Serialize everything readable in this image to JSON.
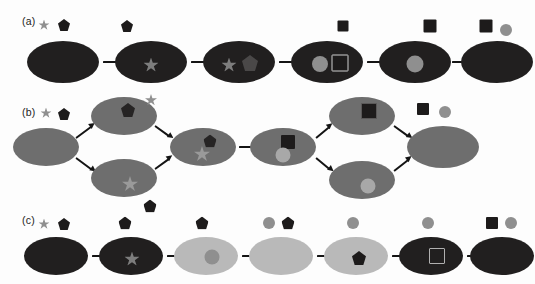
{
  "figure": {
    "background_color": "#fdfdfd",
    "width": 535,
    "height": 284
  },
  "palette": {
    "cell_dark": "#211f1f",
    "cell_mid_gray": "#6e6e6e",
    "cell_light_gray": "#b9b9b9",
    "marker_dark": "#1d1b1b",
    "marker_gray": "#8f8f8f",
    "marker_light_gray": "#a8a8a8",
    "marker_mid_gray": "#7d7d7d",
    "outline_light": "#cfcfcf",
    "arrow_color": "#141414",
    "label_color": "#1c1c1c"
  },
  "panels": [
    {
      "id": "a",
      "label": "(a)",
      "label_x": 22,
      "label_y": 22,
      "topology": "linear",
      "legend": [
        {
          "name": "legend-star",
          "shape": "star",
          "color": "#8f8f8f",
          "x": 44,
          "y": 25,
          "size": 11
        },
        {
          "name": "legend-pentagon",
          "shape": "pentagon",
          "color": "#1d1b1b",
          "x": 64,
          "y": 25,
          "size": 12
        }
      ],
      "stages": [
        {
          "index": 1,
          "cx": 63,
          "cy": 62,
          "rx": 36,
          "ry": 21,
          "fill": "#211f1f",
          "above": [],
          "inner": []
        },
        {
          "index": 2,
          "cx": 151,
          "cy": 62,
          "rx": 36,
          "ry": 21,
          "fill": "#211f1f",
          "above": [
            {
              "name": "pentagon-free",
              "shape": "pentagon",
              "color": "#1d1b1b",
              "dx": -24,
              "dy": -36,
              "size": 12
            }
          ],
          "inner": [
            {
              "name": "star-bound",
              "shape": "star",
              "color": "#7d7d7d",
              "dx": 0,
              "dy": 3,
              "size": 15
            }
          ]
        },
        {
          "index": 3,
          "cx": 239,
          "cy": 62,
          "rx": 36,
          "ry": 21,
          "fill": "#211f1f",
          "above": [],
          "inner": [
            {
              "name": "star-bound",
              "shape": "star",
              "color": "#7d7d7d",
              "dx": -10,
              "dy": 3,
              "size": 15
            },
            {
              "name": "pentagon-outline-bound",
              "shape": "pentagon-outline",
              "color": "#4a4848",
              "dx": 11,
              "dy": 1,
              "size": 16
            }
          ]
        },
        {
          "index": 4,
          "cx": 327,
          "cy": 62,
          "rx": 36,
          "ry": 21,
          "fill": "#211f1f",
          "above": [
            {
              "name": "square-free",
              "shape": "square",
              "color": "#1d1b1b",
              "dx": 16,
              "dy": -36,
              "size": 11
            }
          ],
          "inner": [
            {
              "name": "circle-bound",
              "shape": "circle",
              "color": "#8f8f8f",
              "dx": -7,
              "dy": 2,
              "size": 16
            },
            {
              "name": "square-outline-bound",
              "shape": "square-outline",
              "color": "#1d1b1b",
              "outline": "#cfcfcf",
              "dx": 13,
              "dy": 1,
              "size": 17
            }
          ]
        },
        {
          "index": 5,
          "cx": 415,
          "cy": 62,
          "rx": 36,
          "ry": 21,
          "fill": "#211f1f",
          "above": [
            {
              "name": "square-free",
              "shape": "square",
              "color": "#1d1b1b",
              "dx": 15,
              "dy": -36,
              "size": 13
            }
          ],
          "inner": [
            {
              "name": "circle-bound",
              "shape": "circle",
              "color": "#8f8f8f",
              "dx": 0,
              "dy": 2,
              "size": 17
            }
          ]
        },
        {
          "index": 6,
          "cx": 497,
          "cy": 62,
          "rx": 36,
          "ry": 21,
          "fill": "#211f1f",
          "above": [
            {
              "name": "square-free",
              "shape": "square",
              "color": "#1d1b1b",
              "dx": -11,
              "dy": -36,
              "size": 13
            },
            {
              "name": "circle-free",
              "shape": "circle",
              "color": "#8f8f8f",
              "dx": 9,
              "dy": -32,
              "size": 12
            }
          ],
          "inner": []
        }
      ],
      "arrows": [
        {
          "name": "arrow-a1",
          "x1": 103,
          "y1": 62,
          "x2": 127,
          "y2": 62
        },
        {
          "name": "arrow-a2",
          "x1": 191,
          "y1": 62,
          "x2": 215,
          "y2": 62
        },
        {
          "name": "arrow-a3",
          "x1": 279,
          "y1": 62,
          "x2": 303,
          "y2": 62
        },
        {
          "name": "arrow-a4",
          "x1": 367,
          "y1": 62,
          "x2": 391,
          "y2": 62
        },
        {
          "name": "arrow-a5",
          "x1": 452,
          "y1": 62,
          "x2": 472,
          "y2": 62
        }
      ]
    },
    {
      "id": "b",
      "label": "(b)",
      "label_x": 22,
      "label_y": 113,
      "topology": "branching",
      "legend": [
        {
          "name": "legend-star",
          "shape": "star",
          "color": "#8f8f8f",
          "x": 46,
          "y": 113,
          "size": 11
        },
        {
          "name": "legend-pentagon",
          "shape": "pentagon",
          "color": "#1d1b1b",
          "x": 64,
          "y": 114,
          "size": 12
        }
      ],
      "stages": [
        {
          "index": 1,
          "cx": 46,
          "cy": 147,
          "rx": 33,
          "ry": 19,
          "fill": "#6e6e6e",
          "above": [],
          "inner": []
        },
        {
          "index": 2,
          "cx": 124,
          "cy": 116,
          "rx": 33,
          "ry": 19,
          "fill": "#6e6e6e",
          "above": [
            {
              "name": "star-free",
              "shape": "star",
              "color": "#8f8f8f",
              "dx": 27,
              "dy": -16,
              "size": 12
            }
          ],
          "inner": [
            {
              "name": "pentagon-bound",
              "shape": "pentagon",
              "color": "#262424",
              "dx": 4,
              "dy": -6,
              "size": 14
            }
          ]
        },
        {
          "index": 3,
          "cx": 124,
          "cy": 178,
          "rx": 33,
          "ry": 19,
          "fill": "#6e6e6e",
          "above": [
            {
              "name": "pentagon-free",
              "shape": "pentagon",
              "color": "#1d1b1b",
              "dx": 26,
              "dy": 28,
              "size": 13
            }
          ],
          "inner": [
            {
              "name": "star-bound",
              "shape": "star",
              "color": "#9a9a9a",
              "dx": 6,
              "dy": 6,
              "size": 16
            }
          ]
        },
        {
          "index": 4,
          "cx": 203,
          "cy": 147,
          "rx": 33,
          "ry": 19,
          "fill": "#6e6e6e",
          "above": [],
          "inner": [
            {
              "name": "pentagon-bound",
              "shape": "pentagon",
              "color": "#262424",
              "dx": 7,
              "dy": -6,
              "size": 13
            },
            {
              "name": "star-bound",
              "shape": "star",
              "color": "#9a9a9a",
              "dx": -1,
              "dy": 7,
              "size": 16
            }
          ]
        },
        {
          "index": 5,
          "cx": 283,
          "cy": 147,
          "rx": 33,
          "ry": 19,
          "fill": "#6e6e6e",
          "above": [],
          "inner": [
            {
              "name": "square-bound",
              "shape": "square",
              "color": "#1d1b1b",
              "dx": 5,
              "dy": -5,
              "size": 14
            },
            {
              "name": "circle-bound",
              "shape": "circle",
              "color": "#a8a8a8",
              "dx": 0,
              "dy": 8,
              "size": 15
            }
          ]
        },
        {
          "index": 6,
          "cx": 362,
          "cy": 116,
          "rx": 33,
          "ry": 19,
          "fill": "#6e6e6e",
          "above": [],
          "inner": [
            {
              "name": "square-outline-bound",
              "shape": "square-outline",
              "color": "#1d1b1b",
              "outline": "#5a5858",
              "dx": 7,
              "dy": -5,
              "size": 16
            }
          ]
        },
        {
          "index": 7,
          "cx": 362,
          "cy": 180,
          "rx": 33,
          "ry": 19,
          "fill": "#6e6e6e",
          "above": [],
          "inner": [
            {
              "name": "circle-bound",
              "shape": "circle",
              "color": "#a8a8a8",
              "dx": 6,
              "dy": 6,
              "size": 15
            }
          ]
        },
        {
          "index": 8,
          "cx": 443,
          "cy": 147,
          "rx": 36,
          "ry": 21,
          "fill": "#6e6e6e",
          "above": [
            {
              "name": "square-free",
              "shape": "square",
              "color": "#1d1b1b",
              "dx": -20,
              "dy": -38,
              "size": 12
            },
            {
              "name": "circle-free",
              "shape": "circle",
              "color": "#8f8f8f",
              "dx": 2,
              "dy": -35,
              "size": 12
            }
          ],
          "inner": []
        }
      ],
      "arrows": [
        {
          "name": "arrow-b1-up",
          "x1": 76,
          "y1": 138,
          "x2": 95,
          "y2": 124
        },
        {
          "name": "arrow-b1-down",
          "x1": 76,
          "y1": 158,
          "x2": 95,
          "y2": 172
        },
        {
          "name": "arrow-b2-down",
          "x1": 155,
          "y1": 126,
          "x2": 173,
          "y2": 139
        },
        {
          "name": "arrow-b3-up",
          "x1": 155,
          "y1": 169,
          "x2": 173,
          "y2": 156
        },
        {
          "name": "arrow-b4",
          "x1": 239,
          "y1": 147,
          "x2": 262,
          "y2": 147
        },
        {
          "name": "arrow-b5-up",
          "x1": 316,
          "y1": 138,
          "x2": 333,
          "y2": 124
        },
        {
          "name": "arrow-b5-down",
          "x1": 316,
          "y1": 158,
          "x2": 333,
          "y2": 172
        },
        {
          "name": "arrow-b6-down",
          "x1": 394,
          "y1": 126,
          "x2": 412,
          "y2": 139
        },
        {
          "name": "arrow-b7-up",
          "x1": 394,
          "y1": 171,
          "x2": 412,
          "y2": 157
        }
      ]
    },
    {
      "id": "c",
      "label": "(c)",
      "label_x": 22,
      "label_y": 221,
      "topology": "linear",
      "legend": [
        {
          "name": "legend-star",
          "shape": "star",
          "color": "#8f8f8f",
          "x": 44,
          "y": 224,
          "size": 11
        },
        {
          "name": "legend-pentagon",
          "shape": "pentagon",
          "color": "#1d1b1b",
          "x": 64,
          "y": 224,
          "size": 12
        }
      ],
      "stages": [
        {
          "index": 1,
          "cx": 56,
          "cy": 256,
          "rx": 32,
          "ry": 19,
          "fill": "#211f1f",
          "above": [],
          "inner": []
        },
        {
          "index": 2,
          "cx": 131,
          "cy": 256,
          "rx": 32,
          "ry": 19,
          "fill": "#211f1f",
          "above": [
            {
              "name": "pentagon-free",
              "shape": "pentagon",
              "color": "#1d1b1b",
              "dx": -6,
              "dy": -33,
              "size": 13
            }
          ],
          "inner": [
            {
              "name": "star-bound",
              "shape": "star",
              "color": "#7d7d7d",
              "dx": 1,
              "dy": 3,
              "size": 15
            }
          ]
        },
        {
          "index": 3,
          "cx": 206,
          "cy": 256,
          "rx": 32,
          "ry": 19,
          "fill": "#b9b9b9",
          "above": [
            {
              "name": "pentagon-free",
              "shape": "pentagon",
              "color": "#1d1b1b",
              "dx": -4,
              "dy": -33,
              "size": 13
            }
          ],
          "inner": [
            {
              "name": "circle-bound",
              "shape": "circle",
              "color": "#8f8f8f",
              "dx": 6,
              "dy": 1,
              "size": 15
            }
          ]
        },
        {
          "index": 4,
          "cx": 281,
          "cy": 256,
          "rx": 32,
          "ry": 19,
          "fill": "#b9b9b9",
          "above": [
            {
              "name": "circle-free",
              "shape": "circle",
              "color": "#8f8f8f",
              "dx": -12,
              "dy": -33,
              "size": 12
            },
            {
              "name": "pentagon-free",
              "shape": "pentagon",
              "color": "#1d1b1b",
              "dx": 7,
              "dy": -33,
              "size": 13
            }
          ],
          "inner": []
        },
        {
          "index": 5,
          "cx": 356,
          "cy": 256,
          "rx": 32,
          "ry": 19,
          "fill": "#b9b9b9",
          "above": [
            {
              "name": "circle-free",
              "shape": "circle",
              "color": "#8f8f8f",
              "dx": -3,
              "dy": -33,
              "size": 12
            }
          ],
          "inner": [
            {
              "name": "pentagon-bound",
              "shape": "pentagon",
              "color": "#1d1b1b",
              "dx": 3,
              "dy": 2,
              "size": 14
            }
          ]
        },
        {
          "index": 6,
          "cx": 431,
          "cy": 256,
          "rx": 32,
          "ry": 19,
          "fill": "#211f1f",
          "above": [
            {
              "name": "circle-free",
              "shape": "circle",
              "color": "#8f8f8f",
              "dx": -3,
              "dy": -33,
              "size": 12
            }
          ],
          "inner": [
            {
              "name": "square-outline-bound",
              "shape": "square-outline",
              "color": "#211f1f",
              "outline": "#b0b0b0",
              "dx": 6,
              "dy": 0,
              "size": 16
            }
          ]
        },
        {
          "index": 7,
          "cx": 502,
          "cy": 256,
          "rx": 32,
          "ry": 19,
          "fill": "#211f1f",
          "above": [
            {
              "name": "square-free",
              "shape": "square",
              "color": "#1d1b1b",
              "dx": -10,
              "dy": -33,
              "size": 12
            },
            {
              "name": "circle-free",
              "shape": "circle",
              "color": "#8f8f8f",
              "dx": 9,
              "dy": -33,
              "size": 12
            }
          ],
          "inner": []
        }
      ],
      "arrows": [
        {
          "name": "arrow-c1",
          "x1": 92,
          "y1": 256,
          "x2": 112,
          "y2": 256
        },
        {
          "name": "arrow-c2",
          "x1": 167,
          "y1": 256,
          "x2": 187,
          "y2": 256
        },
        {
          "name": "arrow-c3",
          "x1": 242,
          "y1": 256,
          "x2": 262,
          "y2": 256
        },
        {
          "name": "arrow-c4",
          "x1": 317,
          "y1": 256,
          "x2": 337,
          "y2": 256
        },
        {
          "name": "arrow-c5",
          "x1": 392,
          "y1": 256,
          "x2": 412,
          "y2": 256
        },
        {
          "name": "arrow-c6",
          "x1": 467,
          "y1": 256,
          "x2": 487,
          "y2": 256
        }
      ]
    }
  ]
}
